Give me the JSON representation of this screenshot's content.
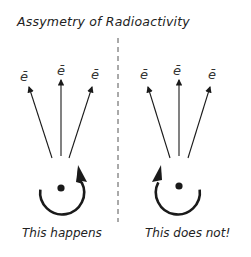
{
  "diagram": {
    "title": "Assymetry of Radioactivity",
    "left_panel": {
      "caption": "This happens",
      "particles": [
        "ē",
        "ē",
        "ē"
      ],
      "rotation": "counterclockwise-arrow-up-right"
    },
    "right_panel": {
      "caption": "This does not!",
      "particles": [
        "ē",
        "ē",
        "ē"
      ],
      "rotation": "clockwise-arrow-up-left"
    },
    "divider": "dashed-vertical-line",
    "colors": {
      "ink": "#1a1a1a",
      "background": "#ffffff"
    }
  }
}
